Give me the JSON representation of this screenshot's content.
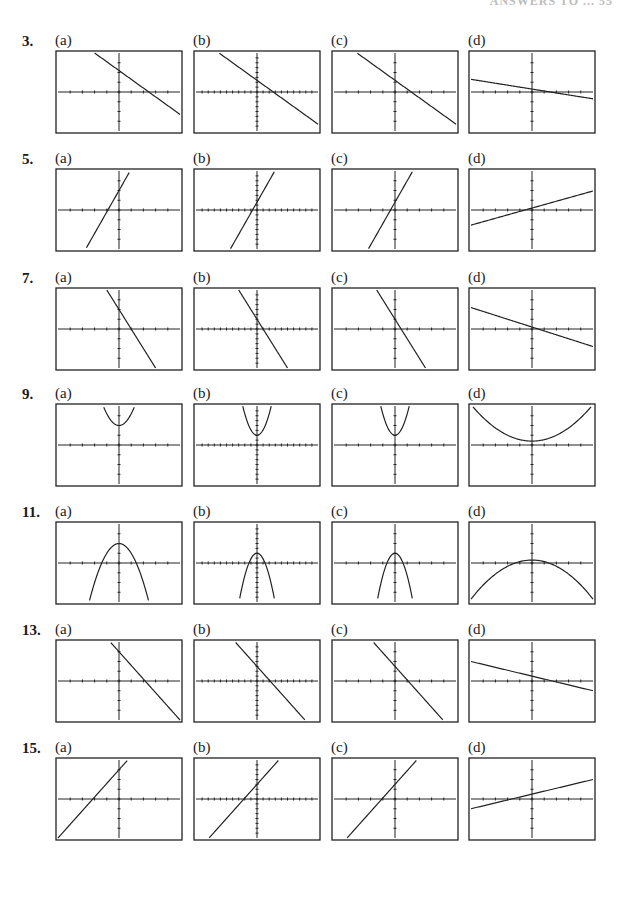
{
  "page": {
    "header": "ANSWERS TO ... 55"
  },
  "chart_data": [
    {
      "problem": "3",
      "type": "line",
      "panels": [
        {
          "label": "(a)",
          "curve": "line",
          "slope": -0.9,
          "intercept": 2.2,
          "xticks": 10,
          "yticks": 8
        },
        {
          "label": "(b)",
          "curve": "line",
          "slope": -0.9,
          "intercept": 1.2,
          "xticks": 20,
          "yticks": 16
        },
        {
          "label": "(c)",
          "curve": "line",
          "slope": -0.9,
          "intercept": 1.2,
          "xticks": 10,
          "yticks": 8
        },
        {
          "label": "(d)",
          "curve": "line",
          "slope": -0.2,
          "intercept": 0.3,
          "xticks": 10,
          "yticks": 8
        }
      ]
    },
    {
      "problem": "5",
      "type": "line",
      "panels": [
        {
          "label": "(a)",
          "curve": "line",
          "slope": 2.2,
          "intercept": 2.0,
          "xticks": 10,
          "yticks": 8
        },
        {
          "label": "(b)",
          "curve": "line",
          "slope": 2.2,
          "intercept": 0.8,
          "xticks": 20,
          "yticks": 16
        },
        {
          "label": "(c)",
          "curve": "line",
          "slope": 2.2,
          "intercept": 0.8,
          "xticks": 10,
          "yticks": 8
        },
        {
          "label": "(d)",
          "curve": "line",
          "slope": 0.35,
          "intercept": 0.2,
          "xticks": 10,
          "yticks": 8
        }
      ]
    },
    {
      "problem": "7",
      "type": "line",
      "panels": [
        {
          "label": "(a)",
          "curve": "line",
          "slope": -2.0,
          "intercept": 2.0,
          "xticks": 10,
          "yticks": 8
        },
        {
          "label": "(b)",
          "curve": "line",
          "slope": -2.0,
          "intercept": 1.0,
          "xticks": 20,
          "yticks": 16
        },
        {
          "label": "(c)",
          "curve": "line",
          "slope": -2.0,
          "intercept": 1.0,
          "xticks": 10,
          "yticks": 8
        },
        {
          "label": "(d)",
          "curve": "line",
          "slope": -0.4,
          "intercept": 0.2,
          "xticks": 10,
          "yticks": 8
        }
      ]
    },
    {
      "problem": "9",
      "type": "line",
      "panels": [
        {
          "label": "(a)",
          "curve": "parabola",
          "a": 1.2,
          "vertex_y": 2.0,
          "xticks": 10,
          "yticks": 8
        },
        {
          "label": "(b)",
          "curve": "parabola",
          "a": 2.2,
          "vertex_y": 1.0,
          "xticks": 20,
          "yticks": 16
        },
        {
          "label": "(c)",
          "curve": "parabola",
          "a": 2.2,
          "vertex_y": 1.0,
          "xticks": 10,
          "yticks": 8
        },
        {
          "label": "(d)",
          "curve": "parabola",
          "a": 0.15,
          "vertex_y": 0.4,
          "xticks": 10,
          "yticks": 8
        }
      ]
    },
    {
      "problem": "11",
      "type": "line",
      "panels": [
        {
          "label": "(a)",
          "curve": "parabola",
          "a": -1.0,
          "vertex_y": 2.0,
          "xticks": 10,
          "yticks": 8
        },
        {
          "label": "(b)",
          "curve": "parabola",
          "a": -2.3,
          "vertex_y": 1.0,
          "xticks": 20,
          "yticks": 16
        },
        {
          "label": "(c)",
          "curve": "parabola",
          "a": -2.3,
          "vertex_y": 1.0,
          "xticks": 10,
          "yticks": 8
        },
        {
          "label": "(d)",
          "curve": "parabola",
          "a": -0.16,
          "vertex_y": 0.3,
          "xticks": 10,
          "yticks": 8
        }
      ]
    },
    {
      "problem": "13",
      "type": "line",
      "panels": [
        {
          "label": "(a)",
          "curve": "line",
          "slope": -1.4,
          "intercept": 3.0,
          "xticks": 10,
          "yticks": 8
        },
        {
          "label": "(b)",
          "curve": "line",
          "slope": -1.4,
          "intercept": 1.5,
          "xticks": 20,
          "yticks": 16
        },
        {
          "label": "(c)",
          "curve": "line",
          "slope": -1.4,
          "intercept": 1.5,
          "xticks": 10,
          "yticks": 8
        },
        {
          "label": "(d)",
          "curve": "line",
          "slope": -0.3,
          "intercept": 0.5,
          "xticks": 10,
          "yticks": 8
        }
      ]
    },
    {
      "problem": "15",
      "type": "line",
      "panels": [
        {
          "label": "(a)",
          "curve": "line",
          "slope": 1.4,
          "intercept": 3.0,
          "xticks": 10,
          "yticks": 8
        },
        {
          "label": "(b)",
          "curve": "line",
          "slope": 1.4,
          "intercept": 1.5,
          "xticks": 20,
          "yticks": 16
        },
        {
          "label": "(c)",
          "curve": "line",
          "slope": 1.4,
          "intercept": 1.5,
          "xticks": 10,
          "yticks": 8
        },
        {
          "label": "(d)",
          "curve": "line",
          "slope": 0.3,
          "intercept": 0.5,
          "xticks": 10,
          "yticks": 8
        }
      ]
    }
  ],
  "layout": {
    "row_tops": [
      33,
      151,
      270,
      386,
      504,
      622,
      740
    ],
    "panel_lefts": [
      55,
      193,
      331,
      468
    ],
    "box_width": 126,
    "box_height": 82,
    "x_range": [
      -5,
      5
    ],
    "y_range": [
      -4,
      4
    ],
    "ink_color": "#222222"
  }
}
